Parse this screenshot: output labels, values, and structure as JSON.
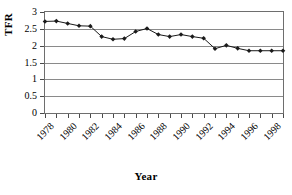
{
  "chart_data": {
    "type": "line",
    "title": "",
    "xlabel": "Year",
    "ylabel": "TFR",
    "xlim": [
      1978,
      1999
    ],
    "ylim": [
      0,
      3
    ],
    "ytick_labels": [
      "3",
      "2.5",
      "2",
      "1.5",
      "1",
      "0.5",
      "0"
    ],
    "ytick_values": [
      3,
      2.5,
      2,
      1.5,
      1,
      0.5,
      0
    ],
    "xtick_labels": [
      "1978",
      "1980",
      "1982",
      "1984",
      "1986",
      "1988",
      "1990",
      "1992",
      "1994",
      "1996",
      "1998"
    ],
    "xtick_values": [
      1978,
      1980,
      1982,
      1984,
      1986,
      1988,
      1990,
      1992,
      1994,
      1996,
      1998
    ],
    "grid": true,
    "legend": "none",
    "marker": "diamond",
    "line_color": "#1a1a1a",
    "marker_color": "#1a1a1a",
    "x": [
      1978,
      1979,
      1980,
      1981,
      1982,
      1983,
      1984,
      1985,
      1986,
      1987,
      1988,
      1989,
      1990,
      1991,
      1992,
      1993,
      1994,
      1995,
      1996,
      1997,
      1998,
      1999
    ],
    "values": [
      2.72,
      2.73,
      2.66,
      2.59,
      2.58,
      2.27,
      2.19,
      2.21,
      2.42,
      2.51,
      2.33,
      2.27,
      2.33,
      2.27,
      2.22,
      1.91,
      2.01,
      1.92,
      1.85,
      1.85,
      1.85,
      1.85
    ],
    "series": [
      {
        "name": "TFR",
        "values": [
          2.72,
          2.73,
          2.66,
          2.59,
          2.58,
          2.27,
          2.19,
          2.21,
          2.42,
          2.51,
          2.33,
          2.27,
          2.33,
          2.27,
          2.22,
          1.91,
          2.01,
          1.92,
          1.85,
          1.85,
          1.85,
          1.85
        ]
      }
    ]
  }
}
